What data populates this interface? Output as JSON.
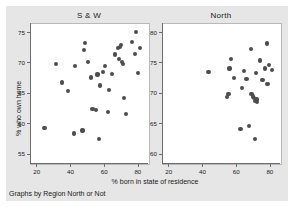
{
  "figure": {
    "note": "Graphs by Region North or Not",
    "xtitle": "% born in state of residence",
    "ytitle": "% who own home",
    "colors": {
      "graph_region": "#e6e6e6",
      "plot_area": "#ffffff",
      "marker": "#4d4d4d",
      "axis": "#6e6e6e",
      "text": "#1a1a1a"
    }
  },
  "chart_data": [
    {
      "type": "scatter",
      "title": "S & W",
      "xlabel": "% born in state of residence",
      "ylabel": "% who own home",
      "xlim": [
        16,
        86
      ],
      "ylim": [
        53.5,
        76.5
      ],
      "xticks": [
        20,
        40,
        60,
        80
      ],
      "yticks": [
        55,
        60,
        65,
        70,
        75
      ],
      "grid": false,
      "legend": "none",
      "points": [
        {
          "x": 24.0,
          "y": 59.4
        },
        {
          "x": 31.0,
          "y": 69.9
        },
        {
          "x": 34.5,
          "y": 66.9
        },
        {
          "x": 38.0,
          "y": 65.5
        },
        {
          "x": 41.5,
          "y": 58.5
        },
        {
          "x": 42.0,
          "y": 69.6
        },
        {
          "x": 46.5,
          "y": 59.0
        },
        {
          "x": 47.5,
          "y": 72.2
        },
        {
          "x": 47.8,
          "y": 73.4
        },
        {
          "x": 50.0,
          "y": 70.2
        },
        {
          "x": 51.5,
          "y": 67.7
        },
        {
          "x": 52.5,
          "y": 62.6
        },
        {
          "x": 54.5,
          "y": 62.4
        },
        {
          "x": 55.5,
          "y": 68.2
        },
        {
          "x": 56.5,
          "y": 57.6
        },
        {
          "x": 57.0,
          "y": 66.4
        },
        {
          "x": 58.5,
          "y": 68.6
        },
        {
          "x": 60.0,
          "y": 69.6
        },
        {
          "x": 61.5,
          "y": 62.1
        },
        {
          "x": 62.5,
          "y": 65.7
        },
        {
          "x": 64.0,
          "y": 68.3
        },
        {
          "x": 66.0,
          "y": 71.5
        },
        {
          "x": 67.5,
          "y": 72.5
        },
        {
          "x": 68.0,
          "y": 70.7
        },
        {
          "x": 69.0,
          "y": 72.7
        },
        {
          "x": 69.5,
          "y": 73.0
        },
        {
          "x": 70.0,
          "y": 70.2
        },
        {
          "x": 70.5,
          "y": 69.9
        },
        {
          "x": 71.0,
          "y": 64.4
        },
        {
          "x": 72.5,
          "y": 61.7
        },
        {
          "x": 76.0,
          "y": 73.6
        },
        {
          "x": 77.5,
          "y": 71.6
        },
        {
          "x": 78.5,
          "y": 75.2
        },
        {
          "x": 79.5,
          "y": 68.4
        },
        {
          "x": 80.5,
          "y": 72.5
        }
      ]
    },
    {
      "type": "scatter",
      "title": "North",
      "xlabel": "% born in state of residence",
      "ylabel": "% who own home",
      "xlim": [
        16,
        86
      ],
      "ylim": [
        58.5,
        81.5
      ],
      "xticks": [
        20,
        40,
        60,
        80
      ],
      "yticks": [
        60,
        65,
        70,
        75,
        80
      ],
      "grid": false,
      "legend": "none",
      "points": [
        {
          "x": 43.0,
          "y": 73.6
        },
        {
          "x": 54.0,
          "y": 69.5
        },
        {
          "x": 54.8,
          "y": 70.0
        },
        {
          "x": 55.5,
          "y": 74.2
        },
        {
          "x": 56.5,
          "y": 75.8
        },
        {
          "x": 58.0,
          "y": 72.6
        },
        {
          "x": 62.0,
          "y": 64.2
        },
        {
          "x": 63.0,
          "y": 71.0
        },
        {
          "x": 64.0,
          "y": 73.8
        },
        {
          "x": 65.5,
          "y": 72.5
        },
        {
          "x": 67.0,
          "y": 64.8
        },
        {
          "x": 68.0,
          "y": 77.4
        },
        {
          "x": 68.5,
          "y": 70.0
        },
        {
          "x": 69.5,
          "y": 69.6
        },
        {
          "x": 70.0,
          "y": 69.3
        },
        {
          "x": 70.5,
          "y": 68.9
        },
        {
          "x": 70.8,
          "y": 62.6
        },
        {
          "x": 71.0,
          "y": 73.5
        },
        {
          "x": 71.5,
          "y": 69.1
        },
        {
          "x": 72.0,
          "y": 68.7
        },
        {
          "x": 73.5,
          "y": 75.5
        },
        {
          "x": 75.0,
          "y": 72.3
        },
        {
          "x": 76.5,
          "y": 74.2
        },
        {
          "x": 77.5,
          "y": 78.3
        },
        {
          "x": 78.0,
          "y": 71.6
        },
        {
          "x": 79.0,
          "y": 74.8
        },
        {
          "x": 80.5,
          "y": 73.9
        }
      ]
    }
  ]
}
